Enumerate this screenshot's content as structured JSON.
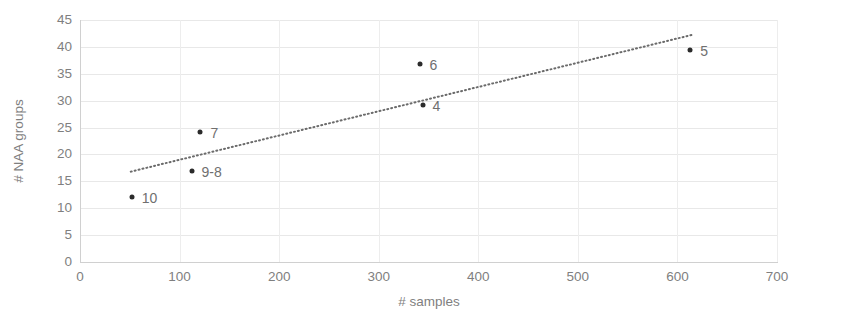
{
  "chart_data": {
    "type": "scatter",
    "title": "",
    "xlabel": "# samples",
    "ylabel": "# NAA groups",
    "xlim": [
      0,
      700
    ],
    "ylim": [
      0,
      45
    ],
    "xticks": [
      0,
      100,
      200,
      300,
      400,
      500,
      600,
      700
    ],
    "yticks": [
      0,
      5,
      10,
      15,
      20,
      25,
      30,
      35,
      40,
      45
    ],
    "grid": true,
    "legend": "none",
    "point_color": "#2b2b2b",
    "label_color": "#6f6f6f",
    "grid_color": "#e8e8e8",
    "axis_color": "#d0d0d0",
    "points": [
      {
        "label": "10",
        "x": 52,
        "y": 12,
        "label_dx": 10,
        "label_dy": 1
      },
      {
        "label": "9-8",
        "x": 112,
        "y": 17,
        "label_dx": 10,
        "label_dy": 1
      },
      {
        "label": "7",
        "x": 121,
        "y": 24.2,
        "label_dx": 10,
        "label_dy": 1
      },
      {
        "label": "6",
        "x": 341,
        "y": 36.8,
        "label_dx": 10,
        "label_dy": 1
      },
      {
        "label": "4",
        "x": 344,
        "y": 29.2,
        "label_dx": 10,
        "label_dy": 1
      },
      {
        "label": "5",
        "x": 613,
        "y": 39.5,
        "label_dx": 10,
        "label_dy": 1
      }
    ],
    "trendline": {
      "style": "dotted",
      "color": "#6b6b6b",
      "x0": 51,
      "y0": 16.8,
      "x1": 614,
      "y1": 42.2
    }
  }
}
